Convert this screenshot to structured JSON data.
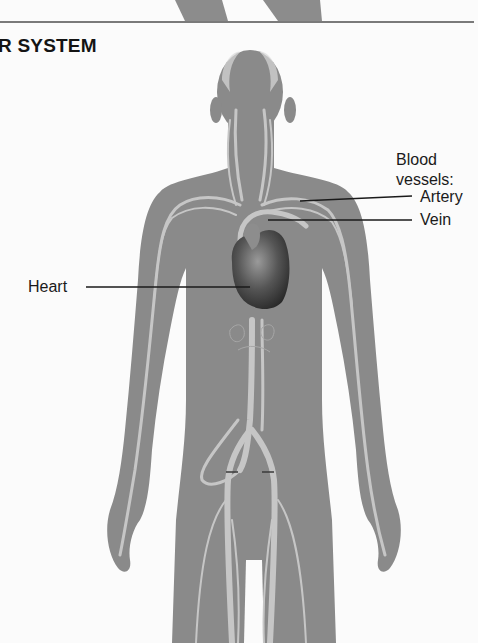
{
  "figure": {
    "title_fragment": "R SYSTEM",
    "labels": {
      "legend_heading_line1": "Blood",
      "legend_heading_line2": "vessels:",
      "artery": "Artery",
      "vein": "Vein",
      "heart": "Heart"
    },
    "colors": {
      "background": "#fbfbfb",
      "body": "#8a8a8a",
      "vessel": "#c4c4c4",
      "heart": "#4a4a4a",
      "leader_line": "#1a1a1a",
      "separator": "#7a7a7a"
    }
  }
}
